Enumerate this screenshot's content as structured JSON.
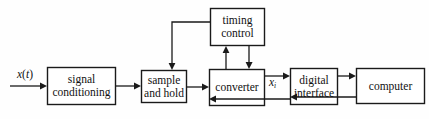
{
  "diagram": {
    "type": "block-diagram",
    "background_color": "#fefefe",
    "line_color": "#1a1a1a",
    "box_fill": "#ffffff",
    "blocks": [
      {
        "id": "signal-conditioning",
        "line1": "signal",
        "line2": "conditioning",
        "x": 47,
        "y": 67,
        "w": 69,
        "h": 38
      },
      {
        "id": "sample-and-hold",
        "line1": "sample",
        "line2": "and hold",
        "x": 141,
        "y": 70,
        "w": 46,
        "h": 33
      },
      {
        "id": "converter",
        "line1": "converter",
        "line2": "",
        "x": 209,
        "y": 69,
        "w": 56,
        "h": 37
      },
      {
        "id": "digital-interface",
        "line1": "digital",
        "line2": "interface",
        "x": 290,
        "y": 68,
        "w": 48,
        "h": 37
      },
      {
        "id": "computer",
        "line1": "computer",
        "line2": "",
        "x": 356,
        "y": 68,
        "w": 69,
        "h": 36
      },
      {
        "id": "timing-control",
        "line1": "timing",
        "line2": "control",
        "x": 210,
        "y": 8,
        "w": 55,
        "h": 38
      }
    ],
    "signal_labels": [
      {
        "id": "input-signal",
        "base": "x",
        "paren_open": "(",
        "var": "t",
        "paren_close": ")",
        "sub": "",
        "x": 17,
        "y": 68
      },
      {
        "id": "digital-signal",
        "base": "x",
        "paren_open": "",
        "var": "",
        "paren_close": "",
        "sub": "i",
        "x": 269,
        "y": 76
      }
    ],
    "connections": [
      {
        "id": "input-to-signal-conditioning",
        "from": "external-input",
        "to": "signal-conditioning",
        "direction": "right"
      },
      {
        "id": "signal-conditioning-to-sample-and-hold",
        "from": "signal-conditioning",
        "to": "sample-and-hold",
        "direction": "right"
      },
      {
        "id": "sample-and-hold-to-converter",
        "from": "sample-and-hold",
        "to": "converter",
        "direction": "right"
      },
      {
        "id": "converter-to-digital-interface",
        "from": "converter",
        "to": "digital-interface",
        "direction": "right",
        "label": "xi"
      },
      {
        "id": "digital-interface-to-converter",
        "from": "digital-interface",
        "to": "converter",
        "direction": "left"
      },
      {
        "id": "digital-interface-to-computer",
        "from": "digital-interface",
        "to": "computer",
        "direction": "right"
      },
      {
        "id": "computer-to-digital-interface",
        "from": "computer",
        "to": "digital-interface",
        "direction": "left"
      },
      {
        "id": "converter-to-timing-control",
        "from": "converter",
        "to": "timing-control",
        "direction": "up"
      },
      {
        "id": "timing-control-to-converter",
        "from": "timing-control",
        "to": "converter",
        "direction": "down"
      },
      {
        "id": "timing-control-to-sample-and-hold",
        "from": "timing-control",
        "to": "sample-and-hold",
        "direction": "down-left"
      }
    ]
  }
}
